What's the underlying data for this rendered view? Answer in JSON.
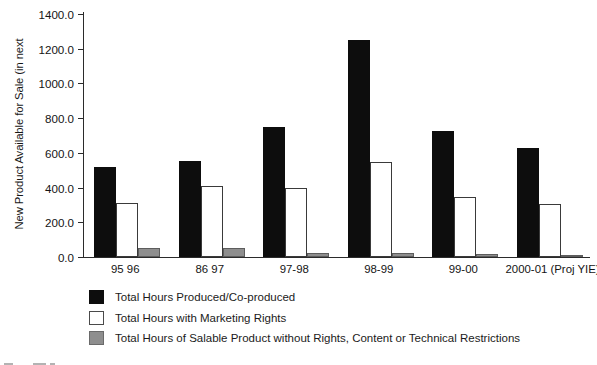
{
  "chart_data": {
    "type": "bar",
    "title": "",
    "xlabel": "",
    "ylabel": "New Product Available for Sale (in next",
    "ylim": [
      0,
      1400
    ],
    "ytick_step": 200,
    "ytick_labels": [
      "0.0",
      "200.0",
      "400.0",
      "600.0",
      "800.0",
      "1000.0",
      "1200.0",
      "1400.0"
    ],
    "grid": false,
    "legend_position": "below-plot-left",
    "categories": [
      "95 96",
      "86 97",
      "97-98",
      "98-99",
      "99-00",
      "2000-01 (Proj YIE)"
    ],
    "series": [
      {
        "name": "Total Hours Produced/Co-produced",
        "color": "#0d0d0d",
        "values": [
          520,
          555,
          750,
          1250,
          725,
          630
        ]
      },
      {
        "name": "Total Hours with Marketing Rights",
        "color": "#ffffff",
        "values": [
          310,
          410,
          395,
          550,
          345,
          305
        ]
      },
      {
        "name": "Total Hours of Salable Product without Rights, Content or Technical Restrictions",
        "color": "#8e8e8e",
        "values": [
          50,
          50,
          25,
          25,
          15,
          10
        ]
      }
    ]
  },
  "legend": {
    "items": [
      "Total Hours Produced/Co-produced",
      "Total Hours with Marketing Rights",
      "Total Hours of Salable Product without Rights, Content or Technical Restrictions"
    ]
  }
}
